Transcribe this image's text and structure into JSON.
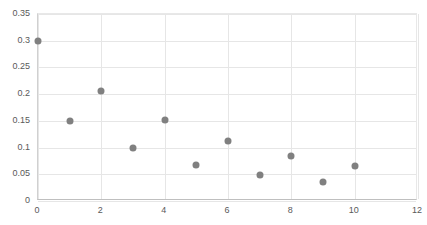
{
  "chart_data": {
    "type": "scatter",
    "title": "",
    "xlabel": "",
    "ylabel": "",
    "xlim": [
      0,
      12
    ],
    "ylim": [
      0,
      0.35
    ],
    "grid": true,
    "legend": false,
    "marker_color": "#808080",
    "x_ticks": [
      0,
      2,
      4,
      6,
      8,
      10,
      12
    ],
    "x_tick_labels": [
      "0",
      "2",
      "4",
      "6",
      "8",
      "10",
      "12"
    ],
    "y_ticks": [
      0,
      0.05,
      0.1,
      0.15,
      0.2,
      0.25,
      0.3,
      0.35
    ],
    "y_tick_labels": [
      "0",
      "0.05",
      "0.1",
      "0.15",
      "0.2",
      "0.25",
      "0.3",
      "0.35"
    ],
    "x": [
      0,
      1,
      2,
      3,
      4,
      5,
      6,
      7,
      8,
      9,
      10
    ],
    "values": [
      0.3,
      0.15,
      0.205,
      0.1,
      0.152,
      0.068,
      0.112,
      0.049,
      0.085,
      0.035,
      0.065
    ],
    "points": [
      {
        "x": 0,
        "y": 0.3
      },
      {
        "x": 1,
        "y": 0.15
      },
      {
        "x": 2,
        "y": 0.205
      },
      {
        "x": 3,
        "y": 0.1
      },
      {
        "x": 4,
        "y": 0.152
      },
      {
        "x": 5,
        "y": 0.068
      },
      {
        "x": 6,
        "y": 0.112
      },
      {
        "x": 7,
        "y": 0.049
      },
      {
        "x": 8,
        "y": 0.085
      },
      {
        "x": 9,
        "y": 0.035
      },
      {
        "x": 10,
        "y": 0.065
      }
    ]
  }
}
